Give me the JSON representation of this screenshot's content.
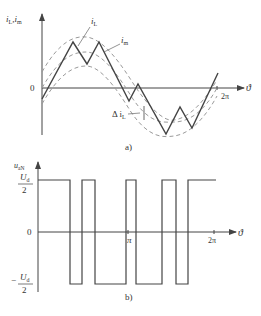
{
  "figure_a": {
    "caption": "a)",
    "y_axis_label": "i",
    "y_axis_sub1": "L",
    "y_axis_sep": ",",
    "y_axis_label2": "i",
    "y_axis_sub2": "m",
    "x_axis_label": "ϑ",
    "origin_label": "0",
    "tick_2pi": "2π",
    "curve_iL_label": "i",
    "curve_iL_sub": "L",
    "curve_im_label": "i",
    "curve_im_sub": "m",
    "ripple_label": "Δ i",
    "ripple_sub": "L"
  },
  "figure_b": {
    "caption": "b)",
    "y_axis_label": "u",
    "y_axis_sub": "aN",
    "x_axis_label": "ϑ",
    "origin_label": "0",
    "tick_pi": "π",
    "tick_2pi": "2π",
    "pos_level_num": "U",
    "pos_level_sub": "d",
    "pos_level_den": "2",
    "neg_sign": "−",
    "neg_level_num": "U",
    "neg_level_sub": "d",
    "neg_level_den": "2"
  },
  "colors": {
    "line": "#444444",
    "dashed": "#9a9a9a"
  }
}
